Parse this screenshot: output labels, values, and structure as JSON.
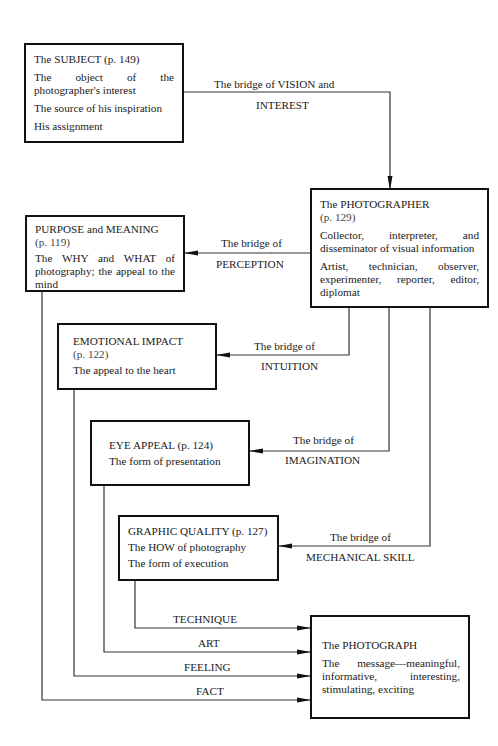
{
  "nodes": {
    "subject": {
      "title": "The SUBJECT",
      "page": "(p. 149)",
      "lines": [
        "The object of the photographer's interest",
        "The source of his inspiration",
        "His assignment"
      ]
    },
    "photographer": {
      "title": "The PHOTOGRAPHER",
      "page": "(p. 129)",
      "lines": [
        "Collector, interpreter, and disseminator of visual information",
        "Artist, technician, observer, experimenter, reporter, editor, diplomat"
      ]
    },
    "purpose": {
      "title": "PURPOSE and MEANING",
      "page": "(p. 119)",
      "lines": [
        "The WHY and WHAT of photography; the appeal to the mind"
      ]
    },
    "emotional": {
      "title": "EMOTIONAL IMPACT",
      "page": "(p. 122)",
      "lines": [
        "The appeal to the heart"
      ]
    },
    "eye": {
      "title": "EYE APPEAL",
      "page": "(p. 124)",
      "lines": [
        "The form of presentation"
      ]
    },
    "graphic": {
      "title": "GRAPHIC QUALITY",
      "page": "(p. 127)",
      "lines": [
        "The HOW of photography",
        "The form of execution"
      ]
    },
    "photograph": {
      "title": "The PHOTOGRAPH",
      "lines": [
        "The message—meaningful, informative, interesting, stimulating, exciting"
      ]
    }
  },
  "edges": {
    "vision": {
      "line1": "The bridge of VISION and",
      "line2": "INTEREST"
    },
    "perception": {
      "line1": "The bridge of",
      "line2": "PERCEPTION"
    },
    "intuition": {
      "line1": "The bridge of",
      "line2": "INTUITION"
    },
    "imagination": {
      "line1": "The bridge of",
      "line2": "IMAGINATION"
    },
    "mechanical": {
      "line1": "The bridge of",
      "line2": "MECHANICAL SKILL"
    },
    "technique": "TECHNIQUE",
    "art": "ART",
    "feeling": "FEELING",
    "fact": "FACT"
  }
}
